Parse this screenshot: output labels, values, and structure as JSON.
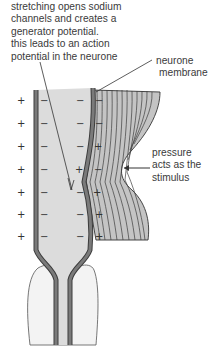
{
  "annotations": {
    "top_caption": [
      "stretching opens sodium",
      "channels and creates a",
      "generator potential.",
      "this leads to an action",
      "potential in the neurone"
    ],
    "membrane_label": [
      "neurone",
      "membrane"
    ],
    "stimulus_label": [
      "pressure",
      "acts as the",
      "stimulus"
    ]
  },
  "signs": {
    "outer_left": [
      "+",
      "+",
      "+",
      "+",
      "+",
      "+",
      "+"
    ],
    "inner_left": [
      "−",
      "−",
      "−",
      "−",
      "−",
      "−",
      "−"
    ],
    "inner_right": [
      "−",
      "−",
      "−",
      "+",
      "−",
      "−",
      "−"
    ],
    "outer_right": [
      "−",
      "−",
      "+",
      "−",
      "+",
      "+",
      "+"
    ]
  },
  "colors": {
    "membrane": "#6e6e6e",
    "membrane_edge": "#3c3c3c",
    "axoplasm": "#d9d9d9",
    "lamellae_fill": "#bdbdbd",
    "lamellae_line": "#444444",
    "base_capsule": "#f2f2f2"
  }
}
